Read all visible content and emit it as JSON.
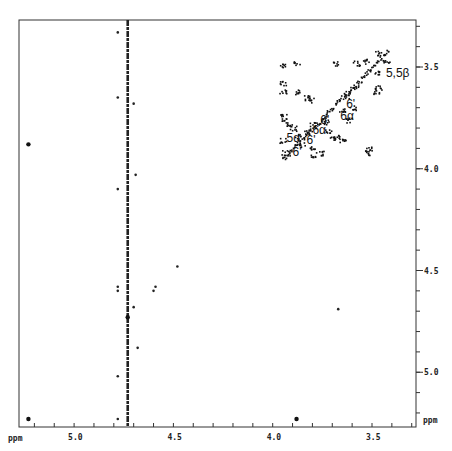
{
  "chart_data": {
    "type": "heatmap",
    "subtype": "2D NMR contour plot (COSY-type, symmetric)",
    "title": "",
    "xlabel": "ppm",
    "ylabel": "ppm",
    "x_range_ppm": [
      5.27,
      3.28
    ],
    "y_range_ppm": [
      3.27,
      5.27
    ],
    "x_axis_reversed": true,
    "x_ticks": [
      {
        "value": 5.0,
        "label": "5.0"
      },
      {
        "value": 4.5,
        "label": "4.5"
      },
      {
        "value": 4.0,
        "label": "4.0"
      },
      {
        "value": 3.5,
        "label": "3.5"
      }
    ],
    "y_ticks": [
      {
        "value": 3.5,
        "label": "3.5"
      },
      {
        "value": 4.0,
        "label": "4.0"
      },
      {
        "value": 4.5,
        "label": "4.5"
      },
      {
        "value": 5.0,
        "label": "5.0"
      }
    ],
    "x_minor_tick_step": 0.1,
    "y_minor_tick_step": 0.1,
    "grid": false,
    "legend": null,
    "artifact_line": {
      "orientation": "vertical",
      "x_ppm": 4.73,
      "note": "solvent (HDO) t1-noise ridge"
    },
    "peak_labels": [
      {
        "text": "5,5β",
        "x_ppm": 3.43,
        "y_ppm": 3.53
      },
      {
        "text": "6'",
        "x_ppm": 3.63,
        "y_ppm": 3.68
      },
      {
        "text": "6α",
        "x_ppm": 3.66,
        "y_ppm": 3.74
      },
      {
        "text": "6'",
        "x_ppm": 3.76,
        "y_ppm": 3.76
      },
      {
        "text": "6α",
        "x_ppm": 3.8,
        "y_ppm": 3.81
      },
      {
        "text": "5α",
        "x_ppm": 3.93,
        "y_ppm": 3.85
      },
      {
        "text": "6'",
        "x_ppm": 3.83,
        "y_ppm": 3.86
      },
      {
        "text": "6'",
        "x_ppm": 3.9,
        "y_ppm": 3.92
      }
    ],
    "isolated_peaks": [
      {
        "x_ppm": 5.23,
        "y_ppm": 3.88
      },
      {
        "x_ppm": 5.23,
        "y_ppm": 5.23
      },
      {
        "x_ppm": 3.88,
        "y_ppm": 5.23
      },
      {
        "x_ppm": 4.73,
        "y_ppm": 4.73
      },
      {
        "x_ppm": 4.7,
        "y_ppm": 3.68
      },
      {
        "x_ppm": 4.7,
        "y_ppm": 4.68
      },
      {
        "x_ppm": 3.67,
        "y_ppm": 4.69
      },
      {
        "x_ppm": 4.48,
        "y_ppm": 4.48
      },
      {
        "x_ppm": 4.59,
        "y_ppm": 4.58
      },
      {
        "x_ppm": 4.6,
        "y_ppm": 4.6
      },
      {
        "x_ppm": 4.78,
        "y_ppm": 4.58
      },
      {
        "x_ppm": 4.78,
        "y_ppm": 4.6
      },
      {
        "x_ppm": 4.78,
        "y_ppm": 3.33
      },
      {
        "x_ppm": 4.78,
        "y_ppm": 3.65
      },
      {
        "x_ppm": 4.78,
        "y_ppm": 4.1
      },
      {
        "x_ppm": 4.69,
        "y_ppm": 4.03
      },
      {
        "x_ppm": 4.68,
        "y_ppm": 4.88
      },
      {
        "x_ppm": 4.78,
        "y_ppm": 5.02
      },
      {
        "x_ppm": 4.78,
        "y_ppm": 5.23
      }
    ],
    "diagonal_cluster_region_ppm": {
      "x": [
        3.4,
        3.98
      ],
      "y": [
        3.4,
        3.98
      ]
    }
  },
  "axes": {
    "x_unit_label": "ppm",
    "y_unit_label": "ppm"
  }
}
